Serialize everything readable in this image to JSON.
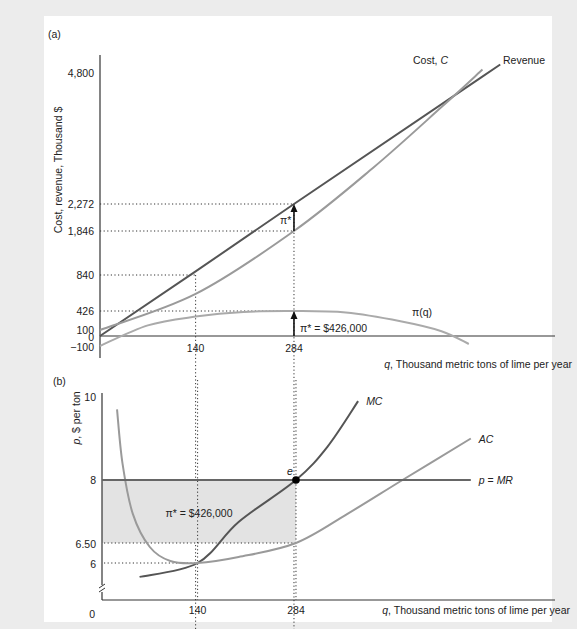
{
  "chart_data": [
    {
      "panel": "(a)",
      "type": "line",
      "ylabel": "Cost, revenue, Thousand $",
      "xlabel_var": "q",
      "xlabel": ", Thousand metric tons of lime per year",
      "yticks": [
        4800,
        2272,
        1846,
        840,
        426,
        100,
        0,
        -100
      ],
      "ytick_labels": [
        "4,800",
        "2,272",
        "1,846",
        "840",
        "426",
        "100",
        "0",
        "−100"
      ],
      "xticks": [
        140,
        284
      ],
      "xtick_labels": [
        "140",
        "284"
      ],
      "x_range": [
        0,
        620
      ],
      "y_range": [
        -100,
        5000
      ],
      "series": [
        {
          "name": "Revenue",
          "label": "Revenue",
          "color": "#555555",
          "points": [
            [
              0,
              0
            ],
            [
              140,
              1120
            ],
            [
              284,
              2272
            ],
            [
              556,
              4448
            ],
            [
              586,
              4688
            ]
          ]
        },
        {
          "name": "Cost",
          "label": "Cost, C",
          "color": "#9a9a9a",
          "points": [
            [
              0,
              100
            ],
            [
              140,
              720
            ],
            [
              284,
              1846
            ],
            [
              400,
              2900
            ],
            [
              500,
              3950
            ],
            [
              560,
              4600
            ]
          ]
        },
        {
          "name": "Profit",
          "label": "π(q)",
          "color": "#aaaaaa",
          "points": [
            [
              0,
              -100
            ],
            [
              70,
              180
            ],
            [
              140,
              330
            ],
            [
              210,
              410
            ],
            [
              284,
              426
            ],
            [
              360,
              400
            ],
            [
              440,
              250
            ],
            [
              500,
              80
            ],
            [
              540,
              -80
            ]
          ]
        }
      ],
      "reference_points": [
        {
          "q": 140,
          "value": 840
        },
        {
          "q": 284,
          "revenue": 2272,
          "cost": 1846
        }
      ],
      "annotations": [
        {
          "text": "π*",
          "at_q": 284,
          "between": [
            1846,
            2272
          ]
        },
        {
          "text": "π* = $426,000",
          "at_q": 284,
          "between": [
            0,
            426
          ]
        }
      ]
    },
    {
      "panel": "(b)",
      "type": "line",
      "ylabel_var": "p",
      "ylabel": ", $ per ton",
      "xlabel_var": "q",
      "xlabel": ", Thousand metric tons of lime per year",
      "yticks": [
        10,
        8,
        6.5,
        6,
        0
      ],
      "ytick_labels": [
        "10",
        "8",
        "6.50",
        "6",
        "0"
      ],
      "xticks": [
        140,
        284
      ],
      "xtick_labels": [
        "140",
        "284"
      ],
      "x_range": [
        0,
        620
      ],
      "y_range": [
        4,
        10
      ],
      "axis_break": true,
      "series": [
        {
          "name": "MC",
          "label": "MC",
          "color": "#555555",
          "points": [
            [
              55,
              5.25
            ],
            [
              140,
              6
            ],
            [
              200,
              7
            ],
            [
              284,
              8
            ],
            [
              330,
              8.8
            ],
            [
              375,
              9.9
            ]
          ]
        },
        {
          "name": "AC",
          "label": "AC",
          "color": "#9a9a9a",
          "points": [
            [
              22,
              9.7
            ],
            [
              30,
              8.4
            ],
            [
              45,
              7.2
            ],
            [
              70,
              6.4
            ],
            [
              100,
              6.05
            ],
            [
              140,
              6
            ],
            [
              200,
              6.15
            ],
            [
              284,
              6.5
            ],
            [
              360,
              7.2
            ],
            [
              440,
              8.0
            ],
            [
              540,
              9.0
            ]
          ]
        },
        {
          "name": "p = MR",
          "label": "p = MR",
          "color": "#666666",
          "points": [
            [
              0,
              8
            ],
            [
              540,
              8
            ]
          ]
        }
      ],
      "shaded_region": {
        "label": "π* = $426,000",
        "q_range": [
          0,
          284
        ],
        "p_range": [
          6.5,
          8
        ],
        "color": "#e3e3e3"
      },
      "equilibrium": {
        "label": "e",
        "q": 284,
        "p": 8
      },
      "reference_points": [
        {
          "q": 140,
          "p": 6
        },
        {
          "q": 284,
          "p": 6.5
        }
      ]
    }
  ]
}
